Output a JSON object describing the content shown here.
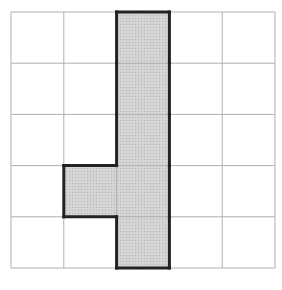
{
  "diagram": {
    "type": "grid-polyomino",
    "rows": 5,
    "cols": 5,
    "origin": [
      11,
      12
    ],
    "cell_size": [
      52.8,
      51.2
    ],
    "grid_line_color": "#b0b0b0",
    "shape_fill": "#d4d4d4",
    "shape_stroke": "#222222",
    "shaded_cells": [
      {
        "row": 0,
        "col": 2
      },
      {
        "row": 1,
        "col": 2
      },
      {
        "row": 2,
        "col": 2
      },
      {
        "row": 3,
        "col": 1
      },
      {
        "row": 3,
        "col": 2
      },
      {
        "row": 4,
        "col": 2
      }
    ]
  }
}
